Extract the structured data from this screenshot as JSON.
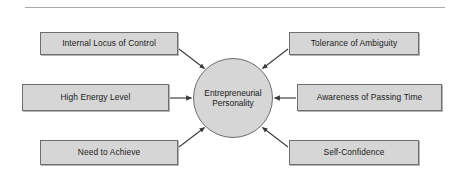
{
  "figure": {
    "type": "hub-and-spoke concept diagram",
    "center": {
      "line1": "Entrepreneurial",
      "line2": "Personality"
    },
    "divider": "top-rule",
    "traits": [
      {
        "label": "Internal Locus of Control",
        "position": "top-left",
        "arrow": "diagonal-down-right"
      },
      {
        "label": "Tolerance of Ambiguity",
        "position": "top-right",
        "arrow": "diagonal-down-left"
      },
      {
        "label": "High Energy Level",
        "position": "middle-left",
        "arrow": "right"
      },
      {
        "label": "Awareness of Passing Time",
        "position": "middle-right",
        "arrow": "left"
      },
      {
        "label": "Need to Achieve",
        "position": "bottom-left",
        "arrow": "diagonal-up-right"
      },
      {
        "label": "Self-Confidence",
        "position": "bottom-right",
        "arrow": "diagonal-up-left"
      }
    ],
    "colors": {
      "node_fill": "#d6d6d6",
      "node_border": "#6e6e6e",
      "arrow": "#3a3a3a",
      "rule": "#a9a9a9",
      "background": "#ffffff",
      "text": "#1a1a1a"
    }
  }
}
